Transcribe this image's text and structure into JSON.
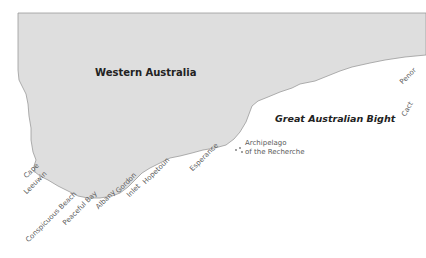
{
  "map": {
    "land_color": "#dedede",
    "coast_color": "#9a9a9a",
    "sea_color": "#ffffff",
    "region_label": "Western Australia",
    "sea_label": "Great Australian Bight",
    "places": [
      {
        "name": "Cape\nLeeuwin",
        "line1": "Cape",
        "line2": "Leeuwin"
      },
      {
        "name": "Conspicuous Beach"
      },
      {
        "name": "Peaceful Bay"
      },
      {
        "name": "Albany"
      },
      {
        "name": "Gordon Inlet",
        "line1": "Gordon",
        "line2": "Inlet"
      },
      {
        "name": "Hopetoun"
      },
      {
        "name": "Esperance"
      },
      {
        "name": "Archipelago of the Recherche",
        "line1": "Archipelago",
        "line2": "of the Recherche"
      },
      {
        "name": "Penong (cut off)",
        "visible": "Penor"
      },
      {
        "name": "Cactus (cut off)",
        "visible": "Cact"
      }
    ]
  }
}
